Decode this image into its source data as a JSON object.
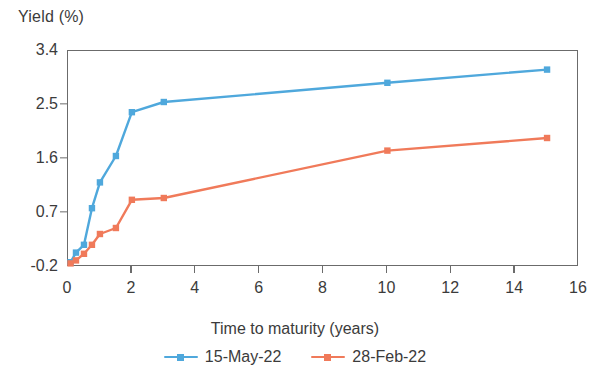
{
  "chart_data": {
    "type": "line",
    "title": "",
    "xlabel": "Time to maturity (years)",
    "ylabel": "Yield (%)",
    "xlim": [
      0,
      16
    ],
    "ylim": [
      -0.2,
      3.4
    ],
    "xticks": [
      0,
      2,
      4,
      6,
      8,
      10,
      12,
      14,
      16
    ],
    "xtick_labels": [
      "0",
      "2",
      "4",
      "6",
      "8",
      "10",
      "12",
      "14",
      "16"
    ],
    "yticks": [
      -0.2,
      0.7,
      1.6,
      2.5,
      3.4
    ],
    "ytick_labels": [
      "-0.2",
      "0.7",
      "1.6",
      "2.5",
      "3.4"
    ],
    "grid": false,
    "legend_position": "bottom",
    "series": [
      {
        "name": "15-May-22",
        "color": "#4fa8dc",
        "marker": "square",
        "x": [
          0.08,
          0.25,
          0.5,
          0.75,
          1,
          1.5,
          2,
          3,
          10,
          15
        ],
        "values": [
          -0.12,
          0.04,
          0.17,
          0.78,
          1.21,
          1.65,
          2.38,
          2.55,
          2.87,
          3.09
        ]
      },
      {
        "name": "28-Feb-22",
        "color": "#f07a5a",
        "marker": "square",
        "x": [
          0.08,
          0.25,
          0.5,
          0.75,
          1,
          1.5,
          2,
          3,
          10,
          15
        ],
        "values": [
          -0.14,
          -0.09,
          0.02,
          0.17,
          0.35,
          0.45,
          0.92,
          0.95,
          1.74,
          1.95
        ]
      }
    ]
  },
  "axes": {
    "y_title": "Yield (%)",
    "x_title": "Time to maturity (years)"
  },
  "legend": {
    "entries": [
      {
        "label": "15-May-22",
        "color": "#4fa8dc"
      },
      {
        "label": "28-Feb-22",
        "color": "#f07a5a"
      }
    ]
  },
  "colors": {
    "series_blue": "#4fa8dc",
    "series_orange": "#f07a5a",
    "axis": "#6b6b6b",
    "text": "#3b3b3b",
    "background": "#ffffff"
  }
}
